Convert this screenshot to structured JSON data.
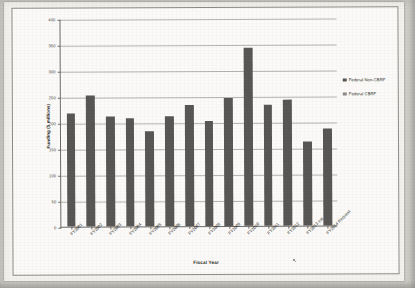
{
  "chart_data": {
    "type": "bar",
    "title": "",
    "xlabel": "Fiscal Year",
    "ylabel": "Funding ($ millions)",
    "ylim": [
      0,
      400
    ],
    "yticks": [
      0,
      50,
      100,
      150,
      200,
      250,
      300,
      350,
      400
    ],
    "grid": true,
    "legend_position": "right",
    "categories": [
      "FY2001",
      "FY2002",
      "FY2003",
      "FY2004",
      "FY2005",
      "FY2006",
      "FY2007",
      "FY2008",
      "FY2009",
      "FY2010",
      "FY2011",
      "FY2012",
      "FY2013 est.",
      "FY2014 Request"
    ],
    "series": [
      {
        "name": "Federal Non-CBRF",
        "color": "#595755",
        "values": [
          218,
          252,
          212,
          208,
          183,
          212,
          232,
          201,
          246,
          342,
          233,
          243,
          161,
          187
        ]
      },
      {
        "name": "Federal CBRF",
        "color": "#8d8b88",
        "values": [
          0,
          0,
          0,
          0,
          0,
          0,
          0,
          0,
          0,
          0,
          0,
          0,
          0,
          0
        ]
      }
    ],
    "legend": [
      "Federal Non-CBRF",
      "Federal CBRF"
    ]
  },
  "axes": {
    "y_title": "Funding ($ millions)",
    "x_title": "Fiscal Year",
    "y_tick_labels": [
      "400",
      "350",
      "300",
      "250",
      "200",
      "150",
      "100",
      "50",
      "0"
    ]
  },
  "legend": {
    "items": [
      {
        "label": "Federal Non-CBRF",
        "color": "#595755"
      },
      {
        "label": "Federal CBRF",
        "color": "#8d8b88"
      }
    ]
  }
}
